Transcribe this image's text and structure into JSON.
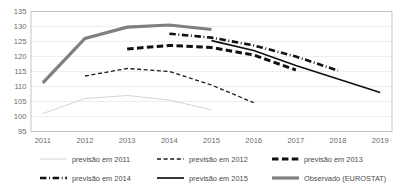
{
  "chart_data": {
    "type": "line",
    "title": "",
    "subtitle": "",
    "xlabel": "",
    "ylabel": "",
    "x": [
      2011,
      2012,
      2013,
      2014,
      2015,
      2016,
      2017,
      2018,
      2019
    ],
    "xlim": [
      2010.72,
      2019.28
    ],
    "ylim": [
      95,
      135
    ],
    "ytick_labels": [
      "135",
      "130",
      "125",
      "120",
      "115",
      "110",
      "105",
      "100",
      "95"
    ],
    "ytick_values": [
      135,
      130,
      125,
      120,
      115,
      110,
      105,
      100,
      95
    ],
    "xtick_labels": [
      "2011",
      "2012",
      "2013",
      "2014",
      "2015",
      "2016",
      "2017",
      "2018",
      "2019"
    ],
    "grid": "horizontal",
    "legend_position": "bottom",
    "series": [
      {
        "name": "previsão em 2011",
        "style": "thin-solid",
        "color": "#c9c9c9",
        "width": 0.8,
        "x": [
          2011,
          2012,
          2013,
          2014,
          2015
        ],
        "values": [
          101.0,
          106.0,
          107.0,
          105.5,
          102.2
        ]
      },
      {
        "name": "previsão em 2012",
        "style": "dashed",
        "color": "#1a1a1a",
        "width": 1.3,
        "x": [
          2012,
          2013,
          2014,
          2015,
          2016
        ],
        "values": [
          113.5,
          116.0,
          115.0,
          110.5,
          104.6
        ]
      },
      {
        "name": "previsão em 2013",
        "style": "thick-dashed",
        "color": "#111111",
        "width": 3.0,
        "x": [
          2013,
          2014,
          2015,
          2016,
          2017
        ],
        "values": [
          122.5,
          123.7,
          123.0,
          120.5,
          115.5
        ]
      },
      {
        "name": "previsão em 2014",
        "style": "dash-dot",
        "color": "#111111",
        "width": 2.6,
        "x": [
          2014,
          2015,
          2016,
          2017,
          2018
        ],
        "values": [
          127.6,
          126.3,
          123.7,
          120.0,
          115.3
        ]
      },
      {
        "name": "previsão em 2015",
        "style": "solid",
        "color": "#111111",
        "width": 1.7,
        "x": [
          2015,
          2016,
          2017,
          2018,
          2019
        ],
        "values": [
          125.3,
          122.0,
          117.0,
          112.5,
          108.0
        ]
      },
      {
        "name": "Observado (EUROSTAT)",
        "style": "thick-solid",
        "color": "#7f7f7f",
        "width": 3.2,
        "x": [
          2011,
          2012,
          2013,
          2014,
          2015
        ],
        "values": [
          111.2,
          126.0,
          129.8,
          130.5,
          129.0
        ]
      }
    ]
  },
  "legend": {
    "rows": [
      [
        {
          "label": "previsão em 2011",
          "style": "thin-solid",
          "color": "#c9c9c9"
        },
        {
          "label": "previsão em 2012",
          "style": "dashed",
          "color": "#1a1a1a"
        },
        {
          "label": "previsão em 2013",
          "style": "thick-dashed",
          "color": "#111111"
        }
      ],
      [
        {
          "label": "previsão em 2014",
          "style": "dash-dot",
          "color": "#111111"
        },
        {
          "label": "previsão em 2015",
          "style": "solid",
          "color": "#111111"
        },
        {
          "label": "Observado (EUROSTAT)",
          "style": "thick-solid",
          "color": "#7f7f7f"
        }
      ]
    ]
  },
  "colors": {
    "plot_border": "#bfbfbf",
    "gridline": "#e8e8e8",
    "axis_text": "#6b6b6b",
    "legend_text": "#4a4a4a",
    "background": "#ffffff"
  }
}
